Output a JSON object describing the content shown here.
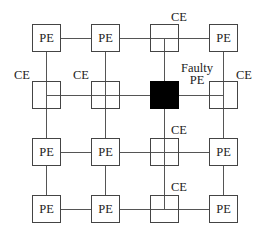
{
  "diagram": {
    "type": "4x4 mesh processor array with faulty PE",
    "grid": [
      [
        {
          "kind": "PE",
          "label": "PE"
        },
        {
          "kind": "PE",
          "label": "PE"
        },
        {
          "kind": "CE",
          "label": ""
        },
        {
          "kind": "PE",
          "label": "PE"
        }
      ],
      [
        {
          "kind": "CE",
          "label": ""
        },
        {
          "kind": "CE",
          "label": ""
        },
        {
          "kind": "faulty",
          "label": ""
        },
        {
          "kind": "CE",
          "label": ""
        }
      ],
      [
        {
          "kind": "PE",
          "label": "PE"
        },
        {
          "kind": "PE",
          "label": "PE"
        },
        {
          "kind": "CE",
          "label": ""
        },
        {
          "kind": "PE",
          "label": "PE"
        }
      ],
      [
        {
          "kind": "PE",
          "label": "PE"
        },
        {
          "kind": "PE",
          "label": "PE"
        },
        {
          "kind": "CE",
          "label": ""
        },
        {
          "kind": "PE",
          "label": "PE"
        }
      ]
    ],
    "annotations": {
      "ce_r0c2": "CE",
      "ce_r1c0": "CE",
      "ce_r1c1": "CE",
      "ce_r1c3": "CE",
      "ce_r2c2": "CE",
      "ce_r3c2": "CE",
      "faulty_line1": "Faulty",
      "faulty_line2": "PE"
    }
  }
}
